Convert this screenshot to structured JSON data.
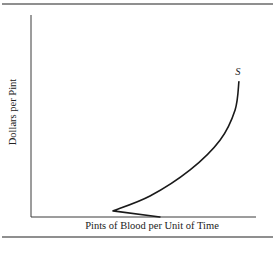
{
  "chart_data": {
    "type": "line",
    "title": "",
    "xlabel": "Pints of Blood per Unit of Time",
    "ylabel": "Dollars per Pint",
    "xlim": [
      0,
      100
    ],
    "ylim": [
      0,
      100
    ],
    "grid": false,
    "ticks": false,
    "series": [
      {
        "name": "S",
        "label": "S",
        "description": "Backward-bending supply curve",
        "x": [
          57.3,
          36.4,
          52.9,
          70.7,
          84.0,
          90.7,
          92.4
        ],
        "y": [
          0,
          3,
          10.4,
          23.3,
          38.0,
          53.0,
          67.0
        ]
      }
    ],
    "legend": "none"
  },
  "colors": {
    "curve": "#1a1a1a",
    "axis": "#3a3a3a",
    "rule": "#6a6a6a"
  }
}
